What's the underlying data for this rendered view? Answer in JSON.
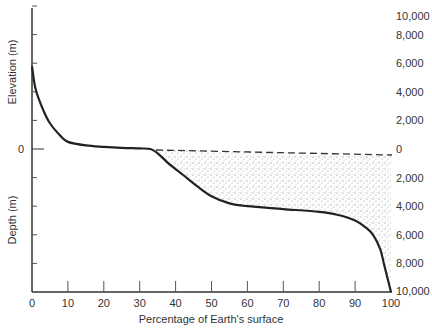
{
  "chart_data": {
    "type": "line",
    "title": "",
    "xlabel": "Percentage of Earth's surface",
    "ylabel_top": "Elevation (m)",
    "ylabel_bottom": "Depth (m)",
    "xlim": [
      0,
      100
    ],
    "ylim": [
      -10000,
      10000
    ],
    "x_ticks": [
      "0",
      "10",
      "20",
      "30",
      "40",
      "50",
      "60",
      "70",
      "80",
      "90",
      "100"
    ],
    "y_ticks_left": [
      "0"
    ],
    "y_ticks_right": [
      "10,000",
      "8,000",
      "6,000",
      "4,000",
      "2,000",
      "0",
      "2,000",
      "4,000",
      "6,000",
      "8,000",
      "10,000"
    ],
    "grid": false,
    "annotations": [
      "Dashed line at sea level (0 m) from ~35% to 100%",
      "Stippled area between sea level and curve represents ocean"
    ],
    "series": [
      {
        "name": "Hypsometric curve",
        "x": [
          0,
          1,
          3,
          5,
          8,
          10,
          15,
          20,
          25,
          30,
          33,
          35,
          38,
          42,
          46,
          50,
          55,
          60,
          70,
          80,
          85,
          90,
          93,
          95,
          97,
          98,
          99,
          100
        ],
        "y": [
          5800,
          4200,
          2800,
          1800,
          900,
          500,
          250,
          150,
          80,
          40,
          0,
          -300,
          -1000,
          -1800,
          -2600,
          -3300,
          -3800,
          -4000,
          -4200,
          -4400,
          -4600,
          -5000,
          -5500,
          -6000,
          -7000,
          -8000,
          -9000,
          -10000
        ]
      }
    ]
  }
}
